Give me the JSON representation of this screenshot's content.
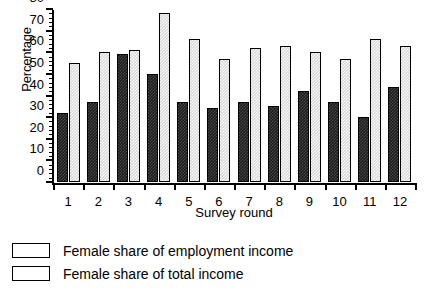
{
  "chart_data": {
    "type": "bar",
    "title": "",
    "xlabel": "Survey round",
    "ylabel": "Percentage",
    "categories": [
      "1",
      "2",
      "3",
      "4",
      "5",
      "6",
      "7",
      "8",
      "9",
      "10",
      "11",
      "12"
    ],
    "ylim": [
      0,
      80
    ],
    "ytick_labels": [
      "0",
      "10",
      "20",
      "30",
      "40",
      "50",
      "60",
      "70",
      "80"
    ],
    "ytick_values": [
      0,
      10,
      20,
      30,
      40,
      50,
      60,
      70,
      80
    ],
    "minor_tick_step": 2,
    "grid": false,
    "legend_position": "below-left",
    "series": [
      {
        "name": "Female share of total income",
        "style": "dark",
        "color": "#1b1b1b",
        "values": [
          32,
          37,
          59,
          50,
          37,
          34,
          37,
          35,
          42,
          37,
          30,
          44
        ]
      },
      {
        "name": "Female share of employment income",
        "style": "light",
        "color": "#d8d8d8",
        "values": [
          55,
          60,
          61,
          78,
          66,
          57,
          62,
          63,
          60,
          57,
          66,
          63
        ]
      }
    ]
  },
  "legend": {
    "items": [
      {
        "label": "Female share of employment income",
        "style": "light"
      },
      {
        "label": "Female share of total income",
        "style": "dark"
      }
    ]
  }
}
